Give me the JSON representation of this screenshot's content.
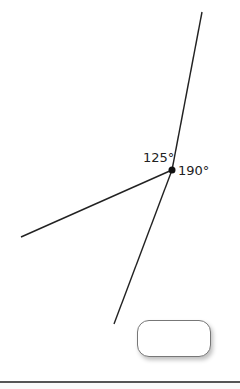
{
  "diagram": {
    "vertex": {
      "x": 172,
      "y": 170
    },
    "rays": [
      {
        "name": "ray-up",
        "x": 202,
        "y": 12
      },
      {
        "name": "ray-left",
        "x": 21,
        "y": 237
      },
      {
        "name": "ray-down",
        "x": 114,
        "y": 324
      }
    ],
    "labels": {
      "angle_a": "125°",
      "angle_b": "190°"
    },
    "line_color": "#222222"
  },
  "answer_button": {
    "label": ""
  }
}
